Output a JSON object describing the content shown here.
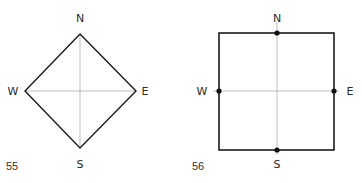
{
  "figures": [
    {
      "number": "55",
      "shape": "diamond",
      "labels": {
        "north": "N",
        "south": "S",
        "east": "E",
        "west": "W"
      }
    },
    {
      "number": "56",
      "shape": "square",
      "labels": {
        "north": "N",
        "south": "S",
        "east": "E",
        "west": "W"
      }
    }
  ],
  "colors": {
    "outline": "#1a1a1a",
    "axis": "#9a9a9a",
    "text": "#2a2a2a"
  }
}
